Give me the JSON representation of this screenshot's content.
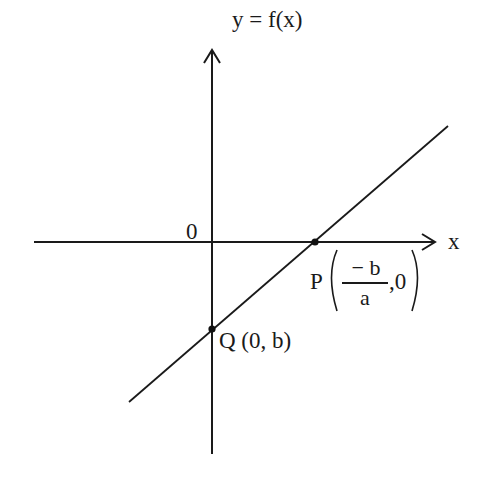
{
  "diagram": {
    "y_axis_label": "y = f(x)",
    "x_axis_label": "x",
    "origin_label": "0",
    "point_p": {
      "name": "P",
      "numerator": "− b",
      "denominator": "a",
      "suffix": ",0",
      "full": "P(−b/a, 0)"
    },
    "point_q": {
      "label": "Q (0, b)"
    },
    "line": {
      "from": [
        129,
        402
      ],
      "to": [
        448,
        126
      ]
    },
    "axes": {
      "x": {
        "from": [
          34,
          242
        ],
        "to": [
          435,
          242
        ]
      },
      "y": {
        "from": [
          212,
          454
        ],
        "to": [
          212,
          50
        ]
      }
    },
    "stroke_color": "#1a1a1a",
    "background": "#ffffff"
  }
}
